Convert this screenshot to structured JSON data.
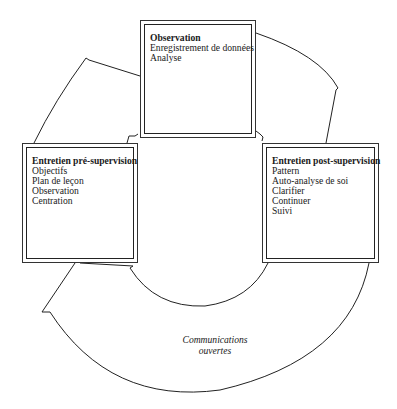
{
  "diagram": {
    "type": "cycle",
    "nodes": [
      {
        "id": "top",
        "title": "Observation",
        "items": [
          "Enregistrement de données",
          "Analyse"
        ]
      },
      {
        "id": "right",
        "title": "Entretien post-supervision",
        "items": [
          "Pattern",
          "Auto-analyse de soi",
          "Clarifier",
          "Continuer",
          "Suivi"
        ]
      },
      {
        "id": "left",
        "title": "Entretien pré-supervision",
        "items": [
          "Objectifs",
          "Plan de leçon",
          "Observation",
          "Centration"
        ]
      }
    ],
    "center": {
      "line1": "Communications",
      "line2": "ouvertes"
    },
    "edges": [
      {
        "from": "left",
        "to": "top"
      },
      {
        "from": "top",
        "to": "right"
      },
      {
        "from": "right",
        "to": "left"
      }
    ],
    "colors": {
      "stroke": "#222222",
      "background": "#ffffff",
      "text": "#1a1a1a"
    }
  }
}
